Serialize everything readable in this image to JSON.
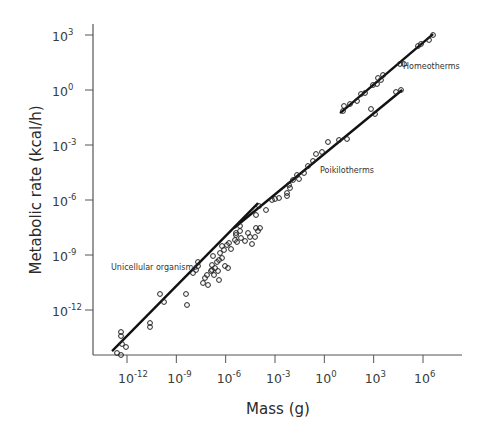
{
  "chart_data": {
    "type": "scatter",
    "title": "",
    "xlabel": "Mass (g)",
    "ylabel": "Metabolic rate (kcal/h)",
    "xscale": "log",
    "yscale": "log",
    "xlim_log10": [
      -12.9,
      9.3
    ],
    "ylim_log10": [
      -14.2,
      3.2
    ],
    "grid": false,
    "legend": null,
    "x_ticks": [
      {
        "exp": -12,
        "label_base": "10",
        "label_exp": "-12"
      },
      {
        "exp": -9,
        "label_base": "10",
        "label_exp": "-9"
      },
      {
        "exp": -6,
        "label_base": "10",
        "label_exp": "-6"
      },
      {
        "exp": -3,
        "label_base": "10",
        "label_exp": "-3"
      },
      {
        "exp": 0,
        "label_base": "10",
        "label_exp": "0"
      },
      {
        "exp": 3,
        "label_base": "10",
        "label_exp": "3"
      },
      {
        "exp": 6,
        "label_base": "10",
        "label_exp": "6"
      }
    ],
    "y_ticks": [
      {
        "exp": 3,
        "label_base": "10",
        "label_exp": "3"
      },
      {
        "exp": 0,
        "label_base": "10",
        "label_exp": "0"
      },
      {
        "exp": -3,
        "label_base": "10",
        "label_exp": "-3"
      },
      {
        "exp": -6,
        "label_base": "10",
        "label_exp": "-6"
      },
      {
        "exp": -9,
        "label_base": "10",
        "label_exp": "-9"
      },
      {
        "exp": -12,
        "label_base": "10",
        "label_exp": "-12"
      }
    ],
    "series": [
      {
        "name": "Unicellular organisms",
        "label_pos_log10": [
          -12.2,
          -9.2
        ],
        "fit_line_log10": [
          [
            -12.91,
            -14.24
          ],
          [
            -4.03,
            -6.17
          ]
        ],
        "points_px": [
          [
            117,
            353
          ],
          [
            121,
            355
          ],
          [
            122,
            344
          ],
          [
            126,
            347
          ],
          [
            121,
            336
          ],
          [
            121,
            332
          ],
          [
            150,
            323
          ],
          [
            150,
            327
          ],
          [
            160,
            294
          ],
          [
            164,
            302
          ],
          [
            186,
            294
          ],
          [
            187,
            305
          ],
          [
            193,
            273
          ],
          [
            196,
            270
          ],
          [
            198,
            266
          ],
          [
            198,
            262
          ],
          [
            203,
            283
          ],
          [
            205,
            278
          ],
          [
            207,
            275
          ],
          [
            211,
            271
          ],
          [
            212,
            265
          ],
          [
            214,
            275
          ],
          [
            215,
            268
          ],
          [
            217,
            262
          ],
          [
            219,
            260
          ],
          [
            218,
            271
          ],
          [
            213,
            256
          ],
          [
            220,
            253
          ],
          [
            222,
            258
          ],
          [
            225,
            266
          ],
          [
            227,
            245
          ],
          [
            224,
            250
          ],
          [
            229,
            243
          ],
          [
            222,
            246
          ],
          [
            231,
            249
          ],
          [
            235,
            240
          ],
          [
            237,
            242
          ],
          [
            240,
            231
          ],
          [
            241,
            238
          ],
          [
            236,
            233
          ],
          [
            245,
            241
          ],
          [
            248,
            233
          ],
          [
            252,
            244
          ],
          [
            256,
            228
          ],
          [
            258,
            231
          ],
          [
            260,
            228
          ],
          [
            255,
            237
          ],
          [
            212,
            270
          ],
          [
            228,
            268
          ],
          [
            219,
            280
          ],
          [
            208,
            285
          ]
        ]
      },
      {
        "name": "Poikilotherms",
        "label_pos_log10": [
          0.1,
          -4.3
        ],
        "fit_line_log10": [
          [
            -5.49,
            -7.53
          ],
          [
            4.73,
            0.0
          ]
        ],
        "points_px": [
          [
            236,
            235
          ],
          [
            240,
            226
          ],
          [
            250,
            237
          ],
          [
            256,
            215
          ],
          [
            259,
            206
          ],
          [
            266,
            210
          ],
          [
            272,
            200
          ],
          [
            275,
            199
          ],
          [
            279,
            198
          ],
          [
            287,
            196
          ],
          [
            289,
            185
          ],
          [
            287,
            193
          ],
          [
            290,
            188
          ],
          [
            293,
            180
          ],
          [
            297,
            175
          ],
          [
            299,
            179
          ],
          [
            304,
            173
          ],
          [
            308,
            166
          ],
          [
            313,
            161
          ],
          [
            316,
            154
          ],
          [
            322,
            152
          ],
          [
            328,
            142
          ],
          [
            339,
            140
          ],
          [
            347,
            139
          ],
          [
            371,
            109
          ],
          [
            375,
            114
          ],
          [
            396,
            92
          ],
          [
            401,
            90
          ]
        ]
      },
      {
        "name": "Homeotherms",
        "label_pos_log10": [
          5.0,
          1.5
        ],
        "fit_line_log10": [
          [
            0.96,
            -1.26
          ],
          [
            6.61,
            3.05
          ]
        ],
        "points_px": [
          [
            343,
            111
          ],
          [
            344,
            106
          ],
          [
            350,
            104
          ],
          [
            357,
            101
          ],
          [
            361,
            94
          ],
          [
            365,
            93
          ],
          [
            373,
            85
          ],
          [
            377,
            84
          ],
          [
            378,
            78
          ],
          [
            381,
            80
          ],
          [
            383,
            75
          ],
          [
            400,
            64
          ],
          [
            404,
            64
          ],
          [
            418,
            46
          ],
          [
            421,
            44
          ],
          [
            429,
            40
          ],
          [
            433,
            35
          ]
        ]
      }
    ]
  },
  "annotations": {
    "unicellular": "Unicellular organisms",
    "poikilotherms": "Poikilotherms",
    "homeotherms": "Homeotherms"
  },
  "axes": {
    "xlabel": "Mass (g)",
    "ylabel": "Metabolic rate (kcal/h)"
  },
  "colors": {
    "axis": "#555555",
    "line": "#111111",
    "marker": "#222222",
    "text": "#333333"
  }
}
